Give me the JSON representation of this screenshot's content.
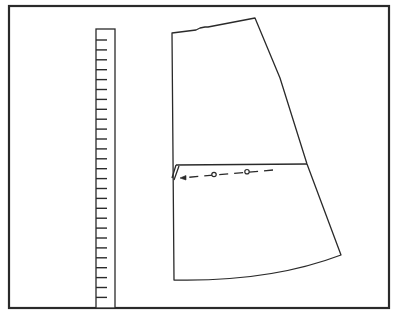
{
  "figure": {
    "colors": {
      "background": "#ffffff",
      "stroke": "#2a2a2a"
    },
    "frame": {
      "x": 9,
      "y": 6,
      "width": 380,
      "height": 302,
      "stroke_width": 2.2
    },
    "ruler": {
      "x": 96,
      "y": 29,
      "width": 19,
      "bottom": 308,
      "tick_count": 27,
      "tick_start_y": 40,
      "tick_spacing": 9.9,
      "tick_length": 11
    },
    "pattern_piece": {
      "outline_path": "M172,33 L196,30 L200,28 L205,27 L208,27 L255,18 L280,78 L307,164 L341,255 Q270,282 174,280 Z",
      "slash_line": {
        "x1": 176,
        "y1": 165,
        "x2": 307,
        "y2": 164
      },
      "fold_marker_path": "M176,165 L172,178 M179,166 L174,180",
      "dashed_arrow": {
        "x1": 273,
        "y1": 170,
        "x2": 180,
        "y2": 178
      },
      "circle_markers": [
        {
          "cx": 214,
          "cy": 174.5
        },
        {
          "cx": 247,
          "cy": 171.7
        }
      ]
    }
  }
}
